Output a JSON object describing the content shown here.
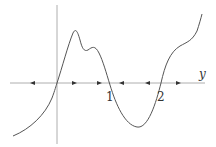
{
  "diagram": {
    "type": "phase-line",
    "axis_label": "y",
    "equilibria": [
      {
        "value": "0",
        "label": "",
        "stability": "unstable"
      },
      {
        "value": "1",
        "label": "1",
        "stability": "stable"
      },
      {
        "value": "2",
        "label": "2",
        "stability": "unstable"
      }
    ],
    "arrows": [
      {
        "position": "y<0",
        "direction": "left"
      },
      {
        "position": "0<y<1",
        "direction": "right"
      },
      {
        "position": "0<y<1",
        "direction": "right"
      },
      {
        "position": "1<y<2",
        "direction": "left"
      },
      {
        "position": "1<y<2",
        "direction": "left"
      },
      {
        "position": "y>2",
        "direction": "right"
      }
    ],
    "colors": {
      "curve": "#555555",
      "axis": "#888888",
      "arrow": "#333333"
    }
  }
}
